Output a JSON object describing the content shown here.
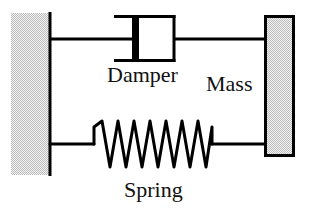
{
  "figure": {
    "background_color": "#ffffff",
    "line_color": "#000000",
    "hatch_fill_color": "#d6d6d6"
  },
  "labels": {
    "damper": "Damper",
    "mass": "Mass",
    "spring": "Spring"
  },
  "components": {
    "wall": {
      "name": "fixed-wall",
      "x": 11,
      "y": 13,
      "width": 39,
      "height": 162,
      "fill": "#d6d6d6",
      "edge_line_x": 50,
      "edge_line_width": 3
    },
    "mass_block": {
      "name": "mass-block",
      "x": 264,
      "y": 15,
      "width": 31,
      "height": 142,
      "fill": "#d6d6d6",
      "stroke": "#000000",
      "stroke_width": 3
    },
    "damper": {
      "name": "damper-element",
      "cylinder_x": 116,
      "cylinder_y": 15,
      "cylinder_width": 58,
      "cylinder_height": 47,
      "piston_bar_x": 133,
      "piston_bar_width": 7,
      "rod_y": 39,
      "rod_left_x": 50,
      "rod_right_x": 264,
      "line_width": 3
    },
    "spring": {
      "name": "spring-element",
      "lead_y": 144,
      "left_lead_start_x": 50,
      "coil_start_x": 95,
      "coil_end_x": 212,
      "right_lead_end_x": 264,
      "coil_count": 7,
      "peak_y": 121,
      "valley_y": 167,
      "line_width": 3
    }
  }
}
